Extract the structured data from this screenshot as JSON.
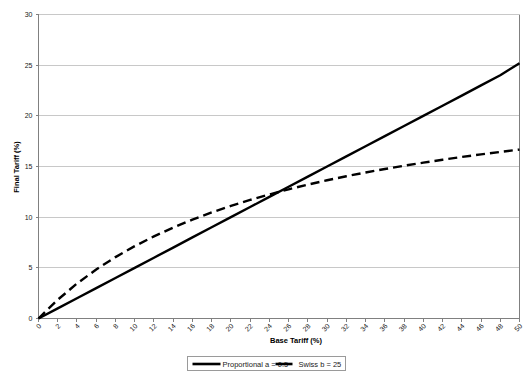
{
  "chart_data": {
    "type": "line",
    "title": "",
    "xlabel": "Base Tariff (%)",
    "ylabel": "Final Tariff (%)",
    "xlim": [
      0,
      50
    ],
    "ylim": [
      0,
      30
    ],
    "xticks": [
      0,
      2,
      4,
      6,
      8,
      10,
      12,
      14,
      16,
      18,
      20,
      22,
      24,
      26,
      28,
      30,
      32,
      34,
      36,
      38,
      40,
      42,
      44,
      46,
      48,
      50
    ],
    "yticks": [
      0,
      5,
      10,
      15,
      20,
      25,
      30
    ],
    "grid": "horizontal",
    "legend_position": "bottom",
    "x": [
      0,
      2,
      4,
      6,
      8,
      10,
      12,
      14,
      16,
      18,
      20,
      22,
      24,
      26,
      28,
      30,
      32,
      34,
      36,
      38,
      40,
      42,
      44,
      46,
      48,
      50
    ],
    "series": [
      {
        "name": "Proportional a = 0.5",
        "style": "solid",
        "color": "#000000",
        "values": [
          0,
          1.0,
          2.0,
          3.0,
          4.0,
          5.0,
          6.0,
          7.0,
          8.0,
          9.0,
          10.0,
          11.0,
          12.0,
          13.0,
          14.0,
          15.0,
          16.0,
          17.0,
          18.0,
          19.0,
          20.0,
          21.0,
          22.0,
          23.0,
          24.0,
          25.2
        ]
      },
      {
        "name": "Swiss b = 25",
        "style": "dashed",
        "color": "#000000",
        "values": [
          0,
          1.85,
          3.45,
          4.84,
          6.06,
          7.14,
          8.11,
          8.97,
          9.76,
          10.47,
          11.11,
          11.7,
          12.24,
          12.75,
          13.21,
          13.64,
          14.04,
          14.41,
          14.75,
          15.08,
          15.38,
          15.67,
          15.94,
          16.2,
          16.44,
          16.67
        ]
      }
    ],
    "annotations": {
      "crossover_x": 25,
      "crossover_y": 12.5
    }
  },
  "legend": {
    "entries": [
      {
        "label": "Proportional a = 0.5"
      },
      {
        "label": "Swiss b = 25"
      }
    ]
  }
}
